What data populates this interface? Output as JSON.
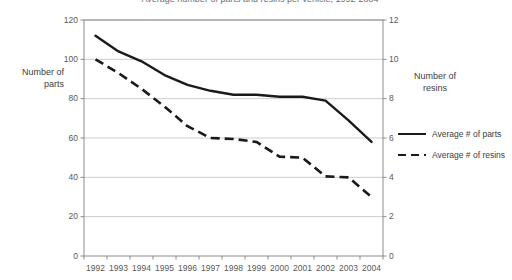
{
  "chart_data": {
    "type": "line",
    "title": "Average number of parts and resins per vehicle, 1992-2004",
    "x": [
      "1992",
      "1993",
      "1994",
      "1995",
      "1996",
      "1997",
      "1998",
      "1999",
      "2000",
      "2001",
      "2002",
      "2003",
      "2004"
    ],
    "xlabel": "",
    "grid": true,
    "legend_position": "right",
    "axes": {
      "left": {
        "label_line1": "Number of",
        "label_line2": "parts",
        "ticks": [
          "0",
          "20",
          "40",
          "60",
          "80",
          "100",
          "120"
        ],
        "min": 0,
        "max": 120,
        "step": 20
      },
      "right": {
        "label_line1": "Number of",
        "label_line2": "resins",
        "ticks": [
          "0",
          "2",
          "4",
          "6",
          "8",
          "10",
          "12"
        ],
        "min": 0,
        "max": 12,
        "step": 2
      }
    },
    "series": [
      {
        "name": "Average # of parts",
        "axis": "left",
        "style": "solid",
        "color": "#1a1a1a",
        "values": [
          112,
          104,
          99,
          92,
          87,
          84,
          82,
          82,
          81,
          81,
          79,
          69,
          58
        ]
      },
      {
        "name": "Average # of resins",
        "axis": "right",
        "style": "dashed",
        "color": "#1a1a1a",
        "values": [
          10.0,
          9.3,
          8.5,
          7.6,
          6.6,
          6.0,
          5.95,
          5.8,
          5.05,
          5.0,
          4.05,
          4.0,
          3.0
        ]
      }
    ]
  },
  "colors": {
    "line": "#1a1a1a",
    "grid": "#bfbfbf",
    "frame": "#808080",
    "text": "#404040",
    "background": "#ffffff"
  }
}
